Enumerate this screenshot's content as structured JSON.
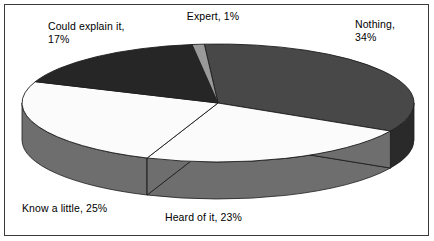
{
  "chart_data": {
    "type": "pie",
    "title": "",
    "subtitle": "",
    "xlabel": "",
    "ylabel": "",
    "legend_position": "none",
    "grid": false,
    "three_d": true,
    "categories": [
      "Nothing",
      "Heard of it",
      "Know a little",
      "Could explain it",
      "Expert"
    ],
    "values": [
      34,
      23,
      25,
      17,
      1
    ],
    "unit": "%",
    "slices": [
      {
        "name": "Nothing",
        "value": 34,
        "label": "Nothing,\n34%",
        "color": "#484848",
        "wall_color": "#2a2a2a"
      },
      {
        "name": "Heard of it",
        "value": 23,
        "label": "Heard of it, 23%",
        "color": "#fbfbfb",
        "wall_color": "#6e6e6e"
      },
      {
        "name": "Know a little",
        "value": 25,
        "label": "Know a little, 25%",
        "color": "#fbfbfb",
        "wall_color": "#6e6e6e"
      },
      {
        "name": "Could explain it",
        "value": 17,
        "label": "Could explain it,\n17%",
        "color": "#262626",
        "wall_color": "#1a1a1a"
      },
      {
        "name": "Expert",
        "value": 1,
        "label": "Expert, 1%",
        "color": "#9a9a9a",
        "wall_color": "#6e6e6e"
      }
    ],
    "colors": {
      "nothing": "#484848",
      "heard_of_it": "#fbfbfb",
      "know_a_little": "#fbfbfb",
      "could_explain_it": "#262626",
      "expert": "#9a9a9a",
      "background": "#ffffff",
      "border": "#3a3a3a",
      "text": "#000000",
      "edge": "#1d1d1d"
    }
  },
  "labels": {
    "expert": "Expert, 1%",
    "nothing": "Nothing,\n34%",
    "could_explain_it": "Could explain it,\n17%",
    "know_a_little": "Know a little, 25%",
    "heard_of_it": "Heard of it, 23%"
  }
}
